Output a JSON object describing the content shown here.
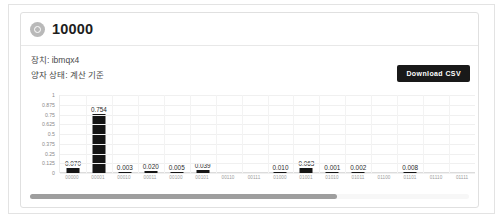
{
  "card": {
    "icon_name": "circle-dot-icon",
    "title": "10000",
    "meta_device": "장치: ibmqx4",
    "meta_state": "양자 상태: 계산 기준",
    "download_label": "Download CSV",
    "button_color": "#191919"
  },
  "scrollbar": {
    "thumb_percent": 70
  },
  "chart_data": {
    "type": "bar",
    "title": "",
    "xlabel": "",
    "ylabel": "",
    "ylim": [
      0,
      1
    ],
    "grid": true,
    "legend": "none",
    "bar_color": "#151515",
    "yticks": [
      "1",
      "0.875",
      "0.75",
      "0.625",
      "0.5",
      "0.375",
      "0.25",
      "0.125",
      "0"
    ],
    "ytick_values": [
      1,
      0.875,
      0.75,
      0.625,
      0.5,
      0.375,
      0.25,
      0.125,
      0
    ],
    "categories": [
      "00000",
      "00001",
      "00010",
      "00011",
      "00100",
      "00101",
      "00110",
      "00111",
      "01000",
      "01001",
      "01010",
      "01011",
      "01100",
      "01101",
      "01110",
      "01111"
    ],
    "values": [
      0.07,
      0.754,
      0.003,
      0.02,
      0.005,
      0.039,
      0,
      0,
      0.01,
      0.063,
      0.001,
      0.002,
      0,
      0.008,
      0,
      0
    ],
    "data_labels": [
      "0.070",
      "0.754",
      "0.003",
      "0.020",
      "0.005",
      "0.039",
      "",
      "",
      "0.010",
      "0.063",
      "0.001",
      "0.002",
      "",
      "0.008",
      "",
      ""
    ]
  }
}
